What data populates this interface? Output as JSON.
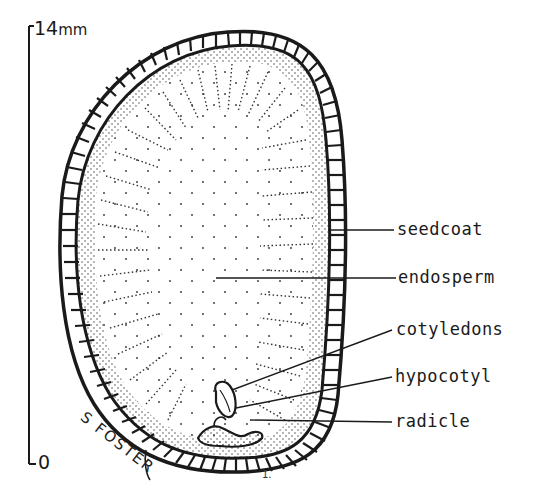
{
  "figure": {
    "scale_bar": {
      "top_label": "14",
      "top_unit": "mm",
      "bottom_label": "0"
    },
    "labels": [
      {
        "id": "seedcoat",
        "text": "seedcoat"
      },
      {
        "id": "endosperm",
        "text": "endosperm"
      },
      {
        "id": "cotyledons",
        "text": "cotyledons"
      },
      {
        "id": "hypocotyl",
        "text": "hypocotyl"
      },
      {
        "id": "radicle",
        "text": "radicle"
      }
    ],
    "signature": "S FOSTER",
    "colors": {
      "ink": "#1a1a1a",
      "background": "#ffffff"
    }
  }
}
